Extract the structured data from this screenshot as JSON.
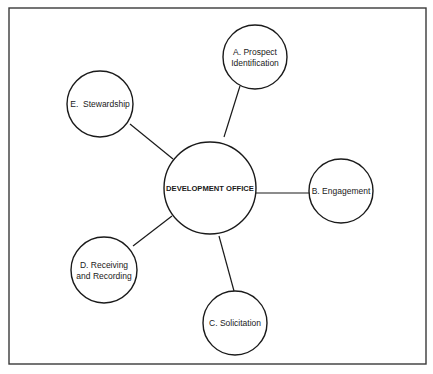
{
  "diagram": {
    "type": "hub-and-spoke",
    "center": {
      "label": "DEVELOPMENT OFFICE"
    },
    "nodes": [
      {
        "id": "A",
        "lines": [
          "A. Prospect",
          "Identification"
        ]
      },
      {
        "id": "B",
        "lines": [
          "B. Engagement"
        ]
      },
      {
        "id": "C",
        "lines": [
          "C. Solicitation"
        ]
      },
      {
        "id": "D",
        "lines": [
          "D. Receiving",
          "and Recording"
        ]
      },
      {
        "id": "E",
        "lines": [
          "E.  Stewardship"
        ]
      }
    ],
    "edges": [
      {
        "from": "center",
        "to": "A"
      },
      {
        "from": "center",
        "to": "B"
      },
      {
        "from": "center",
        "to": "C"
      },
      {
        "from": "center",
        "to": "D"
      },
      {
        "from": "center",
        "to": "E"
      }
    ]
  }
}
